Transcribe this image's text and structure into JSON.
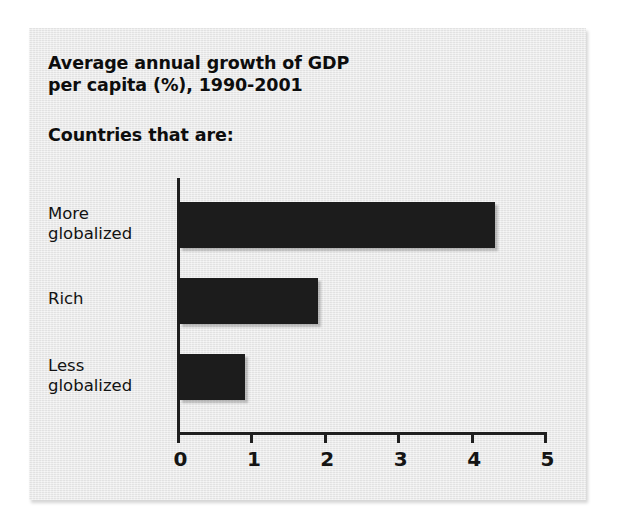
{
  "figure": {
    "panel_color": "#e7e7e7",
    "page_color": "#ffffff",
    "bar_color": "#1c1c1c",
    "axis_color": "#1f1f1f",
    "text_color": "#0d0d0d"
  },
  "chart_data": {
    "type": "bar",
    "orientation": "horizontal",
    "title": "Average annual growth of GDP per capita (%), 1990-2001",
    "title_line1": "Average annual growth of GDP",
    "title_line2": "per capita (%), 1990-2001",
    "subtitle": "Countries that are:",
    "categories": [
      "More globalized",
      "Rich",
      "Less globalized"
    ],
    "values": [
      4.3,
      1.9,
      0.9
    ],
    "xlabel": "",
    "ylabel": "",
    "xlim": [
      0,
      5
    ],
    "xticks": [
      0,
      1,
      2,
      3,
      4,
      5
    ],
    "xtick_labels": [
      "0",
      "1",
      "2",
      "3",
      "4",
      "5"
    ],
    "grid": false,
    "legend": false,
    "bars": [
      {
        "label": "More globalized",
        "label_line1": "More",
        "label_line2": "globalized",
        "value": 4.3
      },
      {
        "label": "Rich",
        "label_line1": "Rich",
        "label_line2": "",
        "value": 1.9
      },
      {
        "label": "Less globalized",
        "label_line1": "Less",
        "label_line2": "globalized",
        "value": 0.9
      }
    ]
  }
}
